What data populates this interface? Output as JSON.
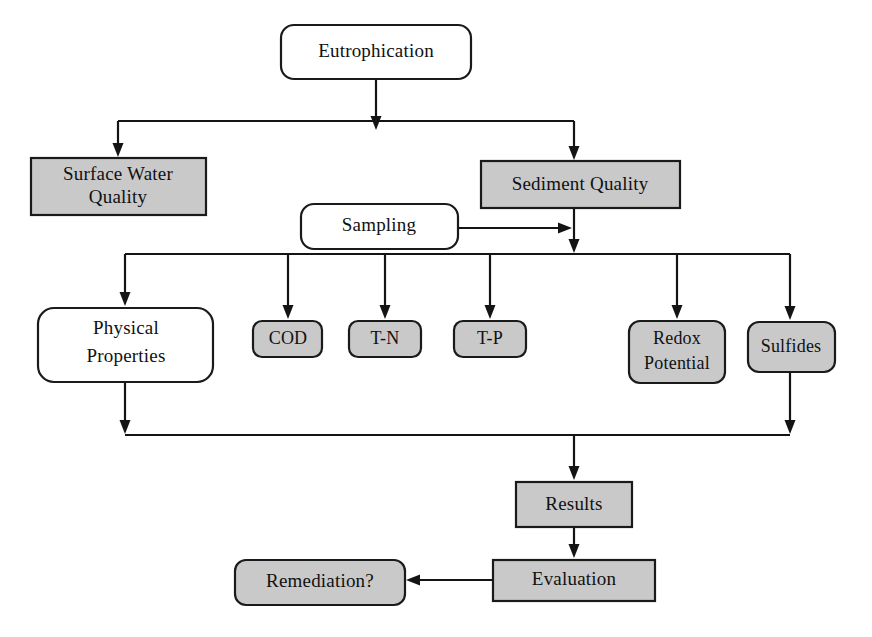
{
  "diagram": {
    "colors": {
      "gray_fill": "#c9c9c9",
      "white_fill": "#ffffff",
      "stroke": "#141414",
      "background": "#ffffff"
    },
    "nodes": [
      {
        "id": "eutrophication",
        "label": "Eutrophication",
        "shape": "rounded-rect",
        "fill": "white",
        "x": 281,
        "y": 25,
        "w": 190,
        "h": 54
      },
      {
        "id": "surface-water",
        "label": "Surface Water",
        "label2": "Quality",
        "shape": "rect",
        "fill": "gray",
        "x": 31,
        "y": 158,
        "w": 175,
        "h": 57
      },
      {
        "id": "sediment-quality",
        "label": "Sediment Quality",
        "shape": "rect",
        "fill": "gray",
        "x": 481,
        "y": 161,
        "w": 199,
        "h": 47
      },
      {
        "id": "sampling",
        "label": "Sampling",
        "shape": "rounded-rect",
        "fill": "white",
        "x": 301,
        "y": 204,
        "w": 157,
        "h": 45
      },
      {
        "id": "physical-properties",
        "label": "Physical",
        "label2": "Properties",
        "shape": "rounded-rect",
        "fill": "white",
        "x": 38,
        "y": 308,
        "w": 175,
        "h": 74
      },
      {
        "id": "cod",
        "label": "COD",
        "shape": "rounded-rect",
        "fill": "gray",
        "x": 253,
        "y": 321,
        "w": 69,
        "h": 36
      },
      {
        "id": "t-n",
        "label": "T-N",
        "shape": "rounded-rect",
        "fill": "gray",
        "x": 349,
        "y": 321,
        "w": 72,
        "h": 36
      },
      {
        "id": "t-p",
        "label": "T-P",
        "shape": "rounded-rect",
        "fill": "gray",
        "x": 454,
        "y": 321,
        "w": 72,
        "h": 36
      },
      {
        "id": "redox-potential",
        "label": "Redox",
        "label2": "Potential",
        "shape": "rounded-rect",
        "fill": "gray",
        "x": 629,
        "y": 321,
        "w": 96,
        "h": 62
      },
      {
        "id": "sulfides",
        "label": "Sulfides",
        "shape": "rounded-rect",
        "fill": "gray",
        "x": 748,
        "y": 322,
        "w": 87,
        "h": 50
      },
      {
        "id": "results",
        "label": "Results",
        "shape": "rect",
        "fill": "gray",
        "x": 516,
        "y": 482,
        "w": 116,
        "h": 45
      },
      {
        "id": "evaluation",
        "label": "Evaluation",
        "shape": "rect",
        "fill": "gray",
        "x": 493,
        "y": 560,
        "w": 162,
        "h": 41
      },
      {
        "id": "remediation",
        "label": "Remediation?",
        "shape": "rounded-rect",
        "fill": "gray",
        "x": 235,
        "y": 560,
        "w": 170,
        "h": 45
      }
    ],
    "edges": [
      {
        "id": "eutrophication-to-split",
        "from": "eutrophication",
        "to": "split-bus-top"
      },
      {
        "id": "split-to-surface-water",
        "from": "split-bus-top",
        "to": "surface-water"
      },
      {
        "id": "split-to-sediment-quality",
        "from": "split-bus-top",
        "to": "sediment-quality"
      },
      {
        "id": "sampling-to-sediment-line",
        "from": "sampling",
        "to": "sediment-quality-outflow"
      },
      {
        "id": "sediment-to-distribution",
        "from": "sediment-quality",
        "to": "distribution-bus"
      },
      {
        "id": "distribution-to-physical",
        "from": "distribution-bus",
        "to": "physical-properties"
      },
      {
        "id": "distribution-to-cod",
        "from": "distribution-bus",
        "to": "cod"
      },
      {
        "id": "distribution-to-tn",
        "from": "distribution-bus",
        "to": "t-n"
      },
      {
        "id": "distribution-to-tp",
        "from": "distribution-bus",
        "to": "t-p"
      },
      {
        "id": "distribution-to-redox",
        "from": "distribution-bus",
        "to": "redox-potential"
      },
      {
        "id": "distribution-to-sulfides",
        "from": "distribution-bus",
        "to": "sulfides"
      },
      {
        "id": "physical-to-collection",
        "from": "physical-properties",
        "to": "collection-bus"
      },
      {
        "id": "sulfides-to-collection",
        "from": "sulfides",
        "to": "collection-bus"
      },
      {
        "id": "collection-to-results",
        "from": "collection-bus",
        "to": "results"
      },
      {
        "id": "results-to-evaluation",
        "from": "results",
        "to": "evaluation"
      },
      {
        "id": "evaluation-to-remediation",
        "from": "evaluation",
        "to": "remediation"
      }
    ]
  }
}
